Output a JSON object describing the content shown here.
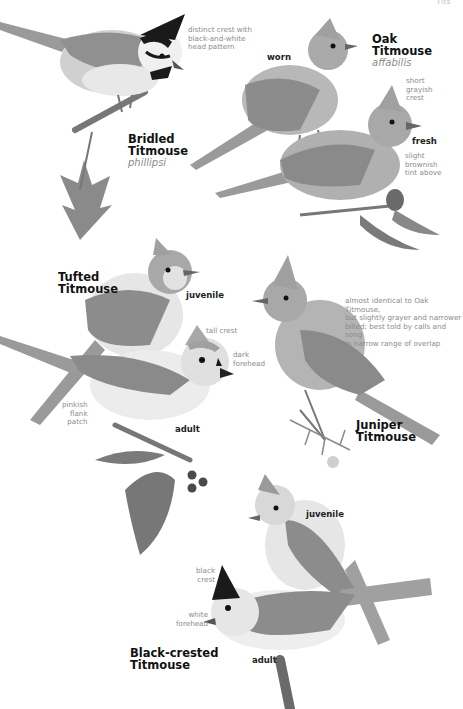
{
  "page": {
    "running_header": "Tits",
    "background": "#ffffff",
    "palette": {
      "bird_gray": "#8f8f8f",
      "bird_light": "#d9d9d9",
      "bird_white": "#f2f2f2",
      "black": "#1a1a1a",
      "foliage": "#7a7a7a",
      "note_text": "#8a8a8a"
    }
  },
  "species": [
    {
      "name": "Bridled\nTitmouse",
      "scientific": "phillipsi",
      "annotations": [
        {
          "text": "distinct crest with\nblack-and-white\nhead pattern"
        }
      ]
    },
    {
      "name": "Oak\nTitmouse",
      "scientific": "affabilis",
      "plumages": [
        "worn",
        "fresh"
      ],
      "annotations": [
        {
          "text": "short\ngrayish\ncrest"
        },
        {
          "text": "slight\nbrownish\ntint above"
        }
      ]
    },
    {
      "name": "Tufted\nTitmouse",
      "plumages": [
        "juvenile",
        "adult"
      ],
      "annotations": [
        {
          "text": "tall crest"
        },
        {
          "text": "dark\nforehead"
        },
        {
          "text": "pinkish\nflank\npatch"
        }
      ]
    },
    {
      "name": "Juniper\nTitmouse",
      "annotations": [
        {
          "text": "almost identical to Oak Titmouse,\nbut slightly grayer and narrower\nbilled; best told by calls and song\nin narrow range of overlap"
        }
      ]
    },
    {
      "name": "Black-crested\nTitmouse",
      "plumages": [
        "juvenile",
        "adult"
      ],
      "annotations": [
        {
          "text": "black\ncrest"
        },
        {
          "text": "white\nforehead"
        }
      ]
    }
  ]
}
